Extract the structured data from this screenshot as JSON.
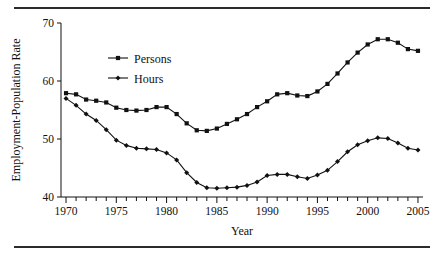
{
  "figure": {
    "rules": {
      "top_visible": true,
      "bottom_visible": true
    },
    "caption_fragment": ""
  },
  "chart_data": {
    "type": "line",
    "title": "",
    "xlabel": "Year",
    "ylabel": "Employment-Population Rate",
    "xlim": [
      1969.5,
      2005.5
    ],
    "ylim": [
      40,
      70
    ],
    "grid": false,
    "legend_position": "upper-left-inside",
    "y_ticks": [
      40,
      50,
      60,
      70
    ],
    "y_tick_labels": [
      "40",
      "50",
      "60",
      "70"
    ],
    "x_ticks": [
      1970,
      1971,
      1972,
      1973,
      1974,
      1975,
      1976,
      1977,
      1978,
      1979,
      1980,
      1981,
      1982,
      1983,
      1984,
      1985,
      1986,
      1987,
      1988,
      1989,
      1990,
      1991,
      1992,
      1993,
      1994,
      1995,
      1996,
      1997,
      1998,
      1999,
      2000,
      2001,
      2002,
      2003,
      2004,
      2005
    ],
    "x_tick_labels_major": [
      "1970",
      "1975",
      "1980",
      "1985",
      "1990",
      "1995",
      "2000",
      "2005"
    ],
    "x_major_ticks": [
      1970,
      1975,
      1980,
      1985,
      1990,
      1995,
      2000,
      2005
    ],
    "x": [
      1970,
      1971,
      1972,
      1973,
      1974,
      1975,
      1976,
      1977,
      1978,
      1979,
      1980,
      1981,
      1982,
      1983,
      1984,
      1985,
      1986,
      1987,
      1988,
      1989,
      1990,
      1991,
      1992,
      1993,
      1994,
      1995,
      1996,
      1997,
      1998,
      1999,
      2000,
      2001,
      2002,
      2003,
      2004,
      2005
    ],
    "series": [
      {
        "name": "Persons",
        "marker": "square",
        "color": "#111111",
        "values": [
          57.9,
          57.7,
          56.8,
          56.6,
          56.3,
          55.4,
          55.0,
          54.9,
          55.0,
          55.5,
          55.5,
          54.3,
          52.7,
          51.5,
          51.4,
          51.8,
          52.6,
          53.4,
          54.3,
          55.5,
          56.5,
          57.7,
          57.9,
          57.5,
          57.4,
          58.2,
          59.5,
          61.3,
          63.2,
          64.9,
          66.3,
          67.2,
          67.2,
          66.6,
          65.5,
          65.2
        ]
      },
      {
        "name": "Hours",
        "marker": "diamond",
        "color": "#111111",
        "values": [
          57.0,
          55.8,
          54.3,
          53.2,
          51.6,
          49.8,
          48.9,
          48.4,
          48.3,
          48.2,
          47.6,
          46.4,
          44.2,
          42.5,
          41.6,
          41.5,
          41.6,
          41.7,
          42.0,
          42.6,
          43.7,
          43.9,
          43.9,
          43.5,
          43.2,
          43.8,
          44.6,
          46.1,
          47.8,
          49.0,
          49.7,
          50.2,
          50.1,
          49.3,
          48.4,
          48.1
        ]
      }
    ],
    "legend": [
      {
        "label": "Persons",
        "marker": "square"
      },
      {
        "label": "Hours",
        "marker": "diamond"
      }
    ]
  }
}
